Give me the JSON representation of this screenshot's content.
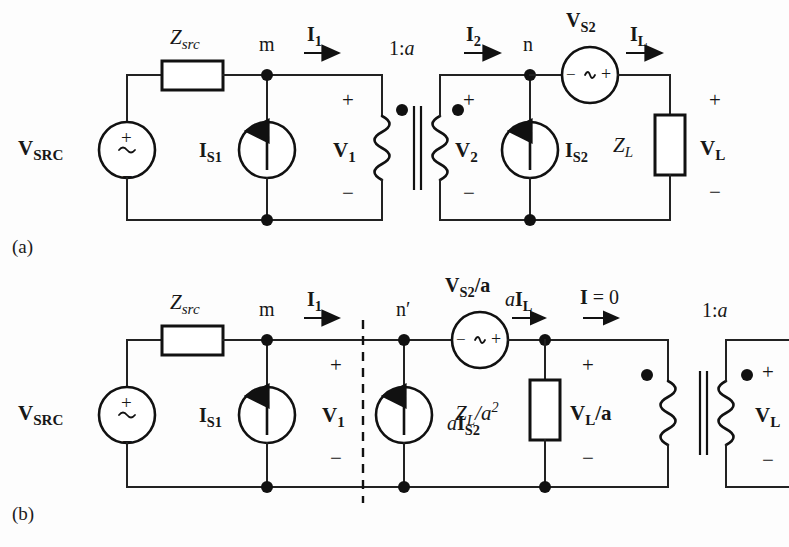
{
  "figure": {
    "panels": [
      {
        "tag": "(a)",
        "caption": "original circuit with ideal transformer"
      },
      {
        "tag": "(b)",
        "caption": "equivalent circuit with secondary elements referred to primary"
      }
    ]
  },
  "panel_a": {
    "tag": "(a)",
    "source": {
      "name": "V_SRC",
      "label_main": "V",
      "label_sub": "SRC",
      "inner_plus": "+",
      "inner_wave": "~",
      "inner_minus": "−"
    },
    "series_impedance": {
      "label_main": "Z",
      "label_sub": "src"
    },
    "node_m": "m",
    "current_i1": {
      "label_main": "I",
      "label_sub": "1"
    },
    "current_source_1": {
      "label_main": "I",
      "label_sub": "S1"
    },
    "voltage_v1": {
      "label_main": "V",
      "label_sub": "1",
      "plus": "+",
      "minus": "−"
    },
    "transformer_ratio": "1:a",
    "current_i2": {
      "label_main": "I",
      "label_sub": "2"
    },
    "voltage_v2": {
      "label_main": "V",
      "label_sub": "2",
      "plus": "+",
      "minus": "−"
    },
    "node_n": "n",
    "source_vs2": {
      "label_main": "V",
      "label_sub": "S2",
      "inner_minus": "−",
      "inner_wave": "∿",
      "inner_plus": "+"
    },
    "current_source_2": {
      "label_main": "I",
      "label_sub": "S2"
    },
    "current_il": {
      "label_main": "I",
      "label_sub": "L"
    },
    "load_impedance": {
      "label_main": "Z",
      "label_sub": "L"
    },
    "voltage_vl": {
      "label_main": "V",
      "label_sub": "L",
      "plus": "+",
      "minus": "−"
    }
  },
  "panel_b": {
    "tag": "(b)",
    "source": {
      "name": "V_SRC",
      "label_main": "V",
      "label_sub": "SRC",
      "inner_plus": "+",
      "inner_wave": "~",
      "inner_minus": "−"
    },
    "series_impedance": {
      "label_main": "Z",
      "label_sub": "src"
    },
    "node_m": "m",
    "current_i1": {
      "label_main": "I",
      "label_sub": "1"
    },
    "current_source_1": {
      "label_main": "I",
      "label_sub": "S1"
    },
    "voltage_v1": {
      "label_main": "V",
      "label_sub": "1",
      "plus": "+",
      "minus": "−"
    },
    "node_n_prime": "n′",
    "source_vs2_over_a": {
      "label_main": "V",
      "label_sub": "S2",
      "label_tail": "/a",
      "inner_minus": "−",
      "inner_wave": "∿",
      "inner_plus": "+"
    },
    "current_source_2_referred": {
      "prefix": "a",
      "label_main": "I",
      "label_sub": "S2"
    },
    "current_ail": {
      "prefix": "a",
      "label_main": "I",
      "label_sub": "L"
    },
    "current_zero": {
      "label_main": "I",
      "label_tail": " = 0"
    },
    "load_impedance_referred": {
      "label_main": "Z",
      "label_sub": "L",
      "label_tail": "/a",
      "exponent": "2"
    },
    "voltage_vl_over_a": {
      "label_main": "V",
      "label_sub": "L",
      "label_tail": "/a",
      "plus": "+",
      "minus": "−"
    },
    "transformer_ratio": "1:a",
    "voltage_vl": {
      "label_main": "V",
      "label_sub": "L",
      "plus": "+",
      "minus": "−"
    }
  },
  "colors": {
    "ink": "#171717",
    "wire": "#222222",
    "paper": "#fdfdfd"
  }
}
